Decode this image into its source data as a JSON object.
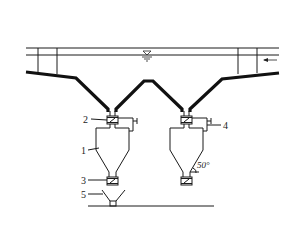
{
  "diagram": {
    "type": "engineering-schematic",
    "labels": {
      "hopper_body": "1",
      "upper_valve": "2",
      "lower_valve": "3",
      "bypass_pipe": "4",
      "discharge_funnel": "5"
    },
    "angle_annotation": "50°",
    "water_level_symbol": "▽",
    "flow_direction": "right-to-left",
    "colors": {
      "line": "#111111",
      "background": "#ffffff"
    }
  }
}
